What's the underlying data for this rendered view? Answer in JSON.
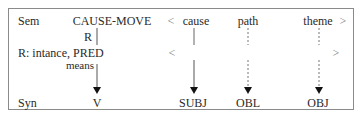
{
  "diagram": {
    "rows": {
      "sem": {
        "label": "Sem",
        "predicate": "CAUSE-MOVE",
        "open_bracket": "<",
        "args": [
          "cause",
          "path",
          "theme"
        ],
        "close_bracket": ">"
      },
      "r_marker": "R",
      "realization": {
        "label": "R: intance, PRED",
        "sublabel": "means",
        "open_bracket": "<",
        "close_bracket": ">"
      },
      "syn": {
        "label": "Syn",
        "functions": [
          "V",
          "SUBJ",
          "OBL",
          "OBJ"
        ]
      }
    },
    "links": [
      {
        "from": "CAUSE-MOVE",
        "to": "V",
        "style": "solid"
      },
      {
        "from": "cause",
        "to": "SUBJ",
        "style": "solid"
      },
      {
        "from": "path",
        "to": "OBL",
        "style": "dashed"
      },
      {
        "from": "theme",
        "to": "OBJ",
        "style": "dashed"
      }
    ],
    "colors": {
      "text": "#2a2a2a",
      "border": "#8a8a8a",
      "line": "#555555"
    }
  }
}
